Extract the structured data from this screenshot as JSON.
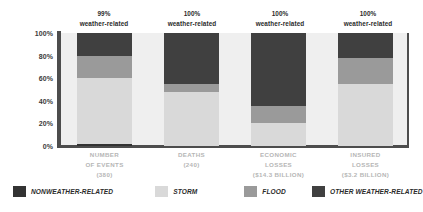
{
  "chart_data": {
    "type": "bar",
    "subtype": "stacked-percentage-column",
    "title": "",
    "xlabel": "",
    "ylabel": "",
    "ylim": [
      0,
      100
    ],
    "yticks": [
      "0%",
      "20%",
      "40%",
      "60%",
      "80%",
      "100%"
    ],
    "ytick_values": [
      0,
      20,
      40,
      60,
      80,
      100
    ],
    "grid": false,
    "legend_position": "bottom",
    "categories": [
      "NUMBER OF EVENTS (380)",
      "DEATHS (240)",
      "ECONOMIC LOSSES ($14.3 BILLION)",
      "INSURED LOSSES ($3.2 BILLION)"
    ],
    "series": [
      {
        "name": "NONWEATHER-RELATED",
        "color": "#333333",
        "values": [
          2,
          0,
          0,
          0
        ]
      },
      {
        "name": "STORM",
        "color": "#d9d9d9",
        "values": [
          58,
          48,
          20,
          55
        ]
      },
      {
        "name": "FLOOD",
        "color": "#9a9a9a",
        "values": [
          20,
          7,
          15,
          23
        ]
      },
      {
        "name": "OTHER WEATHER-RELATED",
        "color": "#404040",
        "values": [
          20,
          45,
          65,
          22
        ]
      }
    ],
    "annotations": [
      {
        "pct": "99%",
        "sub": "weather-related"
      },
      {
        "pct": "100%",
        "sub": "weather-related"
      },
      {
        "pct": "100%",
        "sub": "weather-related"
      },
      {
        "pct": "100%",
        "sub": "weather-related"
      }
    ]
  },
  "axis": {
    "y_ticks": [
      {
        "label": "100%",
        "value": 100
      },
      {
        "label": "80%",
        "value": 80
      },
      {
        "label": "60%",
        "value": 60
      },
      {
        "label": "40%",
        "value": 40
      },
      {
        "label": "20%",
        "value": 20
      },
      {
        "label": "0%",
        "value": 0
      }
    ]
  },
  "categories": [
    {
      "line1": "NUMBER",
      "line2": "OF EVENTS",
      "line3": "(380)"
    },
    {
      "line1": "DEATHS",
      "line2": "(240)",
      "line3": ""
    },
    {
      "line1": "ECONOMIC",
      "line2": "LOSSES",
      "line3": "($14.3 BILLION)"
    },
    {
      "line1": "INSURED",
      "line2": "LOSSES",
      "line3": "($3.2 BILLION)"
    }
  ],
  "legend": {
    "items": [
      {
        "label": "NONWEATHER-RELATED",
        "color": "#333333"
      },
      {
        "label": "STORM",
        "color": "#d9d9d9"
      },
      {
        "label": "FLOOD",
        "color": "#9a9a9a"
      },
      {
        "label": "OTHER WEATHER-RELATED",
        "color": "#404040"
      }
    ]
  },
  "colors": {
    "plot_background": "#efefef",
    "axis": "#4d4d4d",
    "category_text": "#b6b6b6",
    "annotation_text": "#2b2b2b",
    "page_background": "#ffffff"
  }
}
